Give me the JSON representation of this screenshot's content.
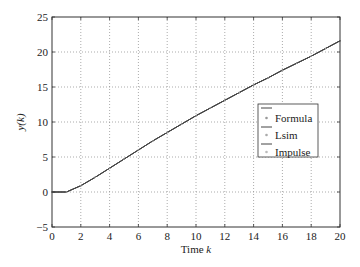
{
  "chart_data": {
    "type": "line",
    "title": "",
    "xlabel": "Time k",
    "xlabel_main": "Time ",
    "xlabel_var": "k",
    "ylabel": "y(k)",
    "xlim": [
      0,
      20
    ],
    "ylim": [
      -5,
      25
    ],
    "xticks": [
      0,
      2,
      4,
      6,
      8,
      10,
      12,
      14,
      16,
      18,
      20
    ],
    "xtick_labels": [
      "0",
      "2",
      "4",
      "6",
      "8",
      "10",
      "12",
      "14",
      "16",
      "18",
      "20"
    ],
    "yticks": [
      -5,
      0,
      5,
      10,
      15,
      20,
      25
    ],
    "ytick_labels": [
      "−5",
      "0",
      "5",
      "10",
      "15",
      "20",
      "25"
    ],
    "grid": true,
    "legend_position": "right-middle",
    "x": [
      0,
      1,
      2,
      3,
      4,
      5,
      6,
      7,
      8,
      9,
      10,
      11,
      12,
      13,
      14,
      15,
      16,
      17,
      18,
      19,
      20
    ],
    "series": [
      {
        "name": "Formula",
        "style": "line+dot",
        "values": [
          0,
          0,
          0.9,
          2.1,
          3.4,
          4.7,
          6.0,
          7.3,
          8.5,
          9.7,
          10.9,
          12.0,
          13.1,
          14.2,
          15.3,
          16.3,
          17.4,
          18.4,
          19.4,
          20.5,
          21.6
        ]
      },
      {
        "name": "Lsim",
        "style": "line+dot",
        "values": [
          0,
          0,
          0.9,
          2.1,
          3.4,
          4.7,
          6.0,
          7.3,
          8.5,
          9.7,
          10.9,
          12.0,
          13.1,
          14.2,
          15.3,
          16.3,
          17.4,
          18.4,
          19.4,
          20.5,
          21.6
        ]
      },
      {
        "name": "Impulse",
        "style": "line+dot",
        "values": [
          0,
          0,
          0.9,
          2.1,
          3.4,
          4.7,
          6.0,
          7.3,
          8.5,
          9.7,
          10.9,
          12.0,
          13.1,
          14.2,
          15.3,
          16.3,
          17.4,
          18.4,
          19.4,
          20.5,
          21.6
        ]
      }
    ]
  },
  "legend": {
    "items": [
      {
        "label": "Formula"
      },
      {
        "label": "Lsim"
      },
      {
        "label": "Impulse"
      }
    ]
  },
  "colors": {
    "line": "#444444",
    "axis": "#333333",
    "grid": "#888888",
    "marker": "#999999"
  }
}
